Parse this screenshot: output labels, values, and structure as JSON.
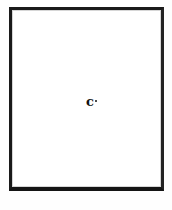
{
  "document": {
    "type": "scanned-page",
    "page_background": "#ffffff",
    "canvas_background": "#fefefe",
    "frame": {
      "name": "page-border-frame",
      "color": "#1a1a1a",
      "style": "solid rectangle outline",
      "left_px": 9,
      "top_px": 7,
      "width_px": 155,
      "height_px": 184
    },
    "content": {
      "is_blank": true,
      "body_text": "",
      "marks": [
        {
          "name": "ink-mark",
          "glyph": "c",
          "description": "small illegible bold ink mark with adjacent dot",
          "color": "#111111",
          "x_px": 85,
          "y_px": 97
        }
      ]
    }
  }
}
